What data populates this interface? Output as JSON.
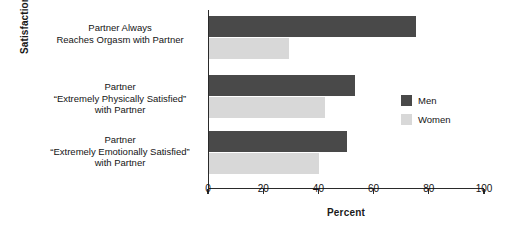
{
  "chart_data": {
    "type": "bar",
    "orientation": "horizontal",
    "title": "",
    "xlabel": "Percent",
    "ylabel": "Satisfaction",
    "xlim": [
      0,
      100
    ],
    "xticks": [
      0,
      20,
      40,
      60,
      80,
      100
    ],
    "xtick_labels": [
      "0",
      "20",
      "40",
      "60",
      "80",
      "100"
    ],
    "grid": false,
    "legend_position": "right",
    "categories": [
      "Partner Always\nReaches Orgasm with Partner",
      "Partner\n“Extremely Physically Satisfied”\nwith Partner",
      "Partner\n“Extremely Emotionally Satisfied”\nwith Partner"
    ],
    "category_lines": [
      [
        "Partner Always",
        "Reaches Orgasm with Partner"
      ],
      [
        "Partner",
        "“Extremely Physically Satisfied”",
        "with Partner"
      ],
      [
        "Partner",
        "“Extremely Emotionally Satisfied”",
        "with Partner"
      ]
    ],
    "series": [
      {
        "name": "Men",
        "color": "#494949",
        "values": [
          75,
          53,
          50
        ]
      },
      {
        "name": "Women",
        "color": "#d8d8d8",
        "values": [
          29,
          42,
          40
        ]
      }
    ]
  },
  "legend": {
    "items": [
      {
        "label": "Men"
      },
      {
        "label": "Women"
      }
    ]
  }
}
